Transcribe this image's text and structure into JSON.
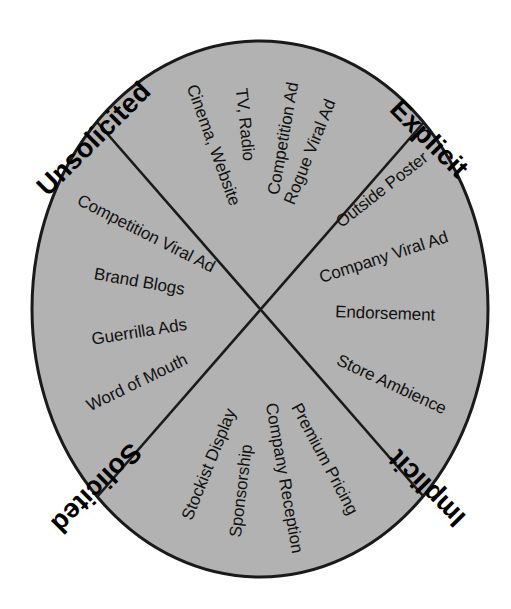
{
  "figure": {
    "type": "quadrant-wheel-diagram",
    "shape": "ellipse",
    "fill_color": "#b2b2b2",
    "outline_color": "#1a1a1a",
    "text_color": "#111111",
    "background_color": "#ffffff",
    "center": {
      "x": 260,
      "y": 309
    },
    "radius": {
      "x": 228,
      "y": 268
    }
  },
  "axes": [
    {
      "id": "unsolicited",
      "label": "Unsolicited",
      "corner": "top-left",
      "rotation": -45,
      "x": 95,
      "y": 140
    },
    {
      "id": "explicit",
      "label": "Explicit",
      "corner": "top-right",
      "rotation": 45,
      "x": 428,
      "y": 140
    },
    {
      "id": "solicited",
      "label": "Solicited",
      "corner": "bottom-left",
      "rotation": -225,
      "x": 95,
      "y": 487
    },
    {
      "id": "implicit",
      "label": "Implicit",
      "corner": "bottom-right",
      "rotation": 225,
      "x": 428,
      "y": 487
    }
  ],
  "quadrants": [
    {
      "id": "unsolicited-explicit",
      "position": "top",
      "between": [
        "Unsolicited",
        "Explicit"
      ],
      "items": [
        {
          "label": "Rogue Viral Ad",
          "angle": -68,
          "radius": 225
        },
        {
          "label": "Competition Ad",
          "angle": -80,
          "radius": 230
        },
        {
          "label": "TV, Radio",
          "angle": -96,
          "radius": 222
        },
        {
          "label": "Cinema, Website",
          "angle": -110,
          "radius": 238
        }
      ]
    },
    {
      "id": "unsolicited-implicit",
      "position": "left",
      "between": [
        "Unsolicited",
        "Solicited"
      ],
      "items": [
        {
          "label": "Competition Viral Ad",
          "angle": -153,
          "radius": 240
        },
        {
          "label": "Brand Blogs",
          "angle": -170,
          "radius": 198
        },
        {
          "label": "Guerrilla Ads",
          "angle": 171,
          "radius": 200
        },
        {
          "label": "Word of Mouth",
          "angle": 154,
          "radius": 225
        }
      ]
    },
    {
      "id": "explicit-implicit",
      "position": "right",
      "between": [
        "Explicit",
        "Implicit"
      ],
      "items": [
        {
          "label": "Outside Poster",
          "angle": -38,
          "radius": 248
        },
        {
          "label": "Company Viral Ad",
          "angle": -18,
          "radius": 232
        },
        {
          "label": "Endorsement",
          "angle": 2,
          "radius": 206
        },
        {
          "label": "Store Ambience",
          "angle": 25,
          "radius": 240
        }
      ]
    },
    {
      "id": "solicited-implicit",
      "position": "bottom",
      "between": [
        "Solicited",
        "Implicit"
      ],
      "items": [
        {
          "label": "Stockist Display",
          "angle": 112,
          "radius": 227
        },
        {
          "label": "Sponsorship",
          "angle": 97,
          "radius": 230
        },
        {
          "label": "Company Reception",
          "angle": 80,
          "radius": 248
        },
        {
          "label": "Premium Pricing",
          "angle": 62,
          "radius": 232
        }
      ]
    }
  ],
  "chart_data": {
    "type": "pie",
    "title": "",
    "categories": [
      "Unsolicited / Explicit",
      "Explicit / Implicit",
      "Solicited / Implicit",
      "Unsolicited / Solicited"
    ],
    "values": [
      25,
      25,
      25,
      25
    ],
    "axis_labels": [
      "Unsolicited",
      "Explicit",
      "Implicit",
      "Solicited"
    ],
    "annotations": [
      "Rogue Viral Ad",
      "Competition Ad",
      "TV, Radio",
      "Cinema, Website",
      "Outside Poster",
      "Company Viral Ad",
      "Endorsement",
      "Store Ambience",
      "Premium Pricing",
      "Company Reception",
      "Sponsorship",
      "Stockist Display",
      "Word of Mouth",
      "Guerrilla Ads",
      "Brand Blogs",
      "Competition Viral Ad"
    ],
    "legend": "none",
    "grid": false
  }
}
